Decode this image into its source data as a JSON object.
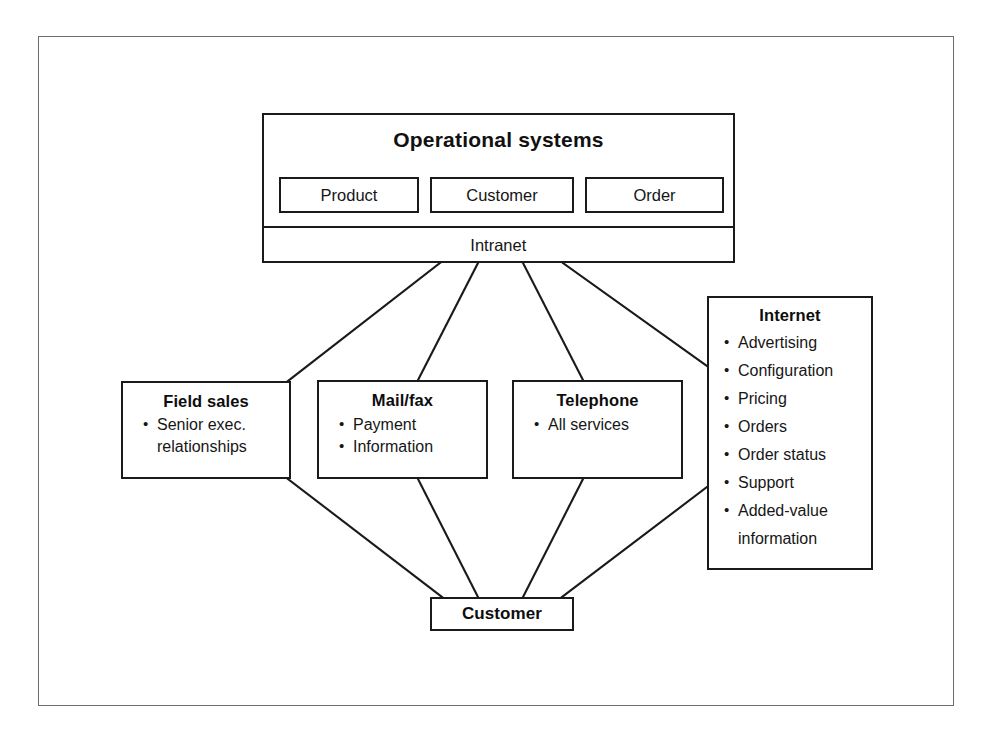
{
  "diagram": {
    "colors": {
      "line": "#1a1a1a",
      "frame": "#6e6e6e",
      "background": "#ffffff",
      "text": "#161616"
    },
    "operational_systems": {
      "title": "Operational systems",
      "subsystems": [
        {
          "label": "Product"
        },
        {
          "label": "Customer"
        },
        {
          "label": "Order"
        }
      ],
      "network_bar": "Intranet"
    },
    "channels": [
      {
        "id": "field-sales",
        "title": "Field sales",
        "items": [
          "Senior exec.",
          "relationships"
        ],
        "continuation": [
          false,
          true
        ]
      },
      {
        "id": "mail-fax",
        "title": "Mail/fax",
        "items": [
          "Payment",
          "Information"
        ],
        "continuation": [
          false,
          false
        ]
      },
      {
        "id": "telephone",
        "title": "Telephone",
        "items": [
          "All services"
        ],
        "continuation": [
          false
        ]
      },
      {
        "id": "internet",
        "title": "Internet",
        "items": [
          "Advertising",
          "Configuration",
          "Pricing",
          "Orders",
          "Order status",
          "Support",
          "Added-value",
          "information"
        ],
        "continuation": [
          false,
          false,
          false,
          false,
          false,
          false,
          false,
          true
        ]
      }
    ],
    "customer": {
      "title": "Customer"
    }
  }
}
